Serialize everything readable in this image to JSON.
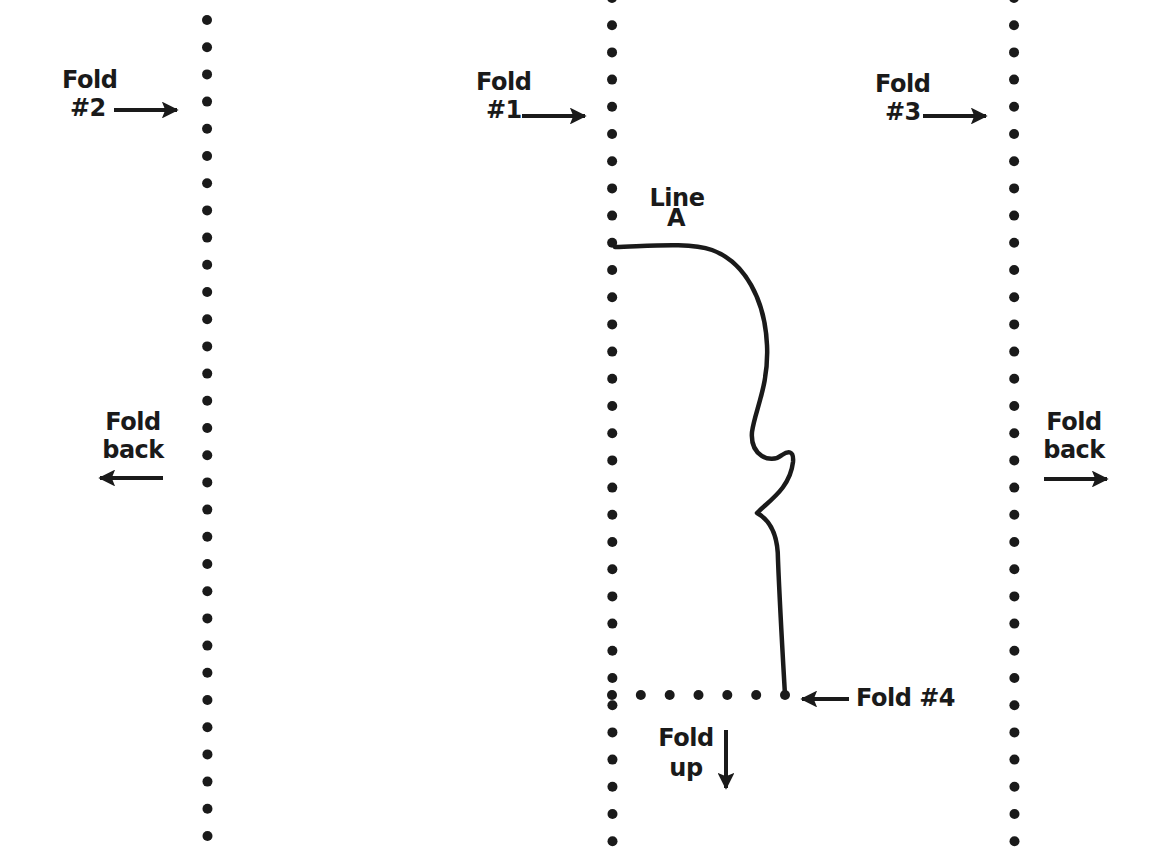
{
  "diagram": {
    "type": "folding-pattern",
    "ink_color": "#1a1a1a",
    "background": "#ffffff",
    "fold_lines": [
      {
        "id": "fold-2",
        "x": 207,
        "orientation": "vertical",
        "style": "dotted"
      },
      {
        "id": "fold-1",
        "x": 612,
        "orientation": "vertical",
        "style": "dotted"
      },
      {
        "id": "fold-3",
        "x": 1014,
        "orientation": "vertical",
        "style": "dotted"
      },
      {
        "id": "fold-4",
        "y": 695,
        "x_start": 612,
        "x_end": 785,
        "orientation": "horizontal",
        "style": "dotted"
      }
    ],
    "labels": {
      "fold2": {
        "line1": "Fold",
        "line2": "#2"
      },
      "fold1": {
        "line1": "Fold",
        "line2": "#1"
      },
      "fold3": {
        "line1": "Fold",
        "line2": "#3"
      },
      "fold_back_left": {
        "line1": "Fold",
        "line2": "back"
      },
      "fold_back_right": {
        "line1": "Fold",
        "line2": "back"
      },
      "line_a": {
        "line1": "Line",
        "line2": "A"
      },
      "fold4": {
        "text": "Fold #4"
      },
      "fold_up": {
        "line1": "Fold",
        "line2": "up"
      }
    },
    "arrows": [
      {
        "label": "fold2",
        "direction": "right"
      },
      {
        "label": "fold1",
        "direction": "right"
      },
      {
        "label": "fold3",
        "direction": "right"
      },
      {
        "label": "fold_back_left",
        "direction": "left"
      },
      {
        "label": "fold_back_right",
        "direction": "right"
      },
      {
        "label": "fold4",
        "direction": "left"
      },
      {
        "label": "fold_up",
        "direction": "down"
      }
    ]
  }
}
